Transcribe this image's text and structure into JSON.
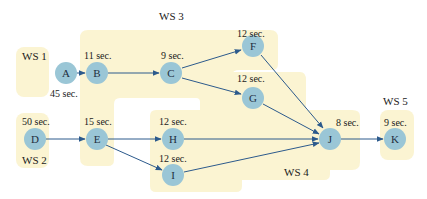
{
  "diagram": {
    "type": "precedence-network",
    "colors": {
      "station_fill": "#fbf4d2",
      "node_fill": "#9ac6d6",
      "edge": "#2c5a8c"
    },
    "workstations": [
      {
        "id": "ws1",
        "label": "WS 1",
        "tasks": [
          "A"
        ]
      },
      {
        "id": "ws2",
        "label": "WS 2",
        "tasks": [
          "D"
        ]
      },
      {
        "id": "ws3",
        "label": "WS 3",
        "tasks": [
          "B",
          "C",
          "F",
          "G",
          "E"
        ]
      },
      {
        "id": "ws4",
        "label": "WS 4",
        "tasks": [
          "H",
          "I",
          "J"
        ]
      },
      {
        "id": "ws5",
        "label": "WS 5",
        "tasks": [
          "K"
        ]
      }
    ],
    "nodes": [
      {
        "id": "A",
        "time": "45 sec."
      },
      {
        "id": "B",
        "time": "11 sec."
      },
      {
        "id": "C",
        "time": "9 sec."
      },
      {
        "id": "D",
        "time": "50 sec."
      },
      {
        "id": "E",
        "time": "15 sec."
      },
      {
        "id": "F",
        "time": "12 sec."
      },
      {
        "id": "G",
        "time": "12 sec."
      },
      {
        "id": "H",
        "time": "12 sec."
      },
      {
        "id": "I",
        "time": "12 sec."
      },
      {
        "id": "J",
        "time": "8 sec."
      },
      {
        "id": "K",
        "time": "9 sec."
      }
    ],
    "edges": [
      [
        "A",
        "B"
      ],
      [
        "B",
        "C"
      ],
      [
        "C",
        "F"
      ],
      [
        "C",
        "G"
      ],
      [
        "F",
        "J"
      ],
      [
        "G",
        "J"
      ],
      [
        "D",
        "E"
      ],
      [
        "E",
        "H"
      ],
      [
        "E",
        "I"
      ],
      [
        "H",
        "J"
      ],
      [
        "I",
        "J"
      ],
      [
        "J",
        "K"
      ]
    ]
  }
}
